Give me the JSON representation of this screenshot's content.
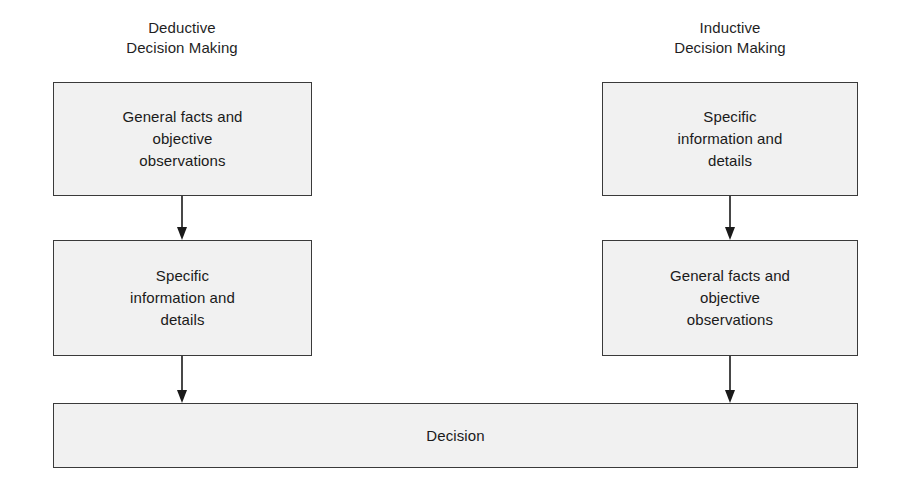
{
  "diagram": {
    "canvas": {
      "width": 904,
      "height": 491,
      "background": "#ffffff"
    },
    "colors": {
      "box_fill": "#f1f1f1",
      "box_border": "#3a3a3a",
      "text": "#1a1a1a",
      "arrow": "#1a1a1a"
    },
    "columns": [
      {
        "heading": "Deductive\nDecision Making",
        "steps": [
          "General facts and\nobjective\nobservations",
          "Specific\ninformation and\ndetails"
        ]
      },
      {
        "heading": "Inductive\nDecision Making",
        "steps": [
          "Specific\ninformation and\ndetails",
          "General facts and\nobjective\nobservations"
        ]
      }
    ],
    "outcome": {
      "label": "Decision"
    },
    "connectors": [
      {
        "name": "deductive-step1-to-step2",
        "direction": "down"
      },
      {
        "name": "deductive-step2-to-decision",
        "direction": "down"
      },
      {
        "name": "inductive-step1-to-step2",
        "direction": "down"
      },
      {
        "name": "inductive-step2-to-decision",
        "direction": "down"
      }
    ]
  }
}
